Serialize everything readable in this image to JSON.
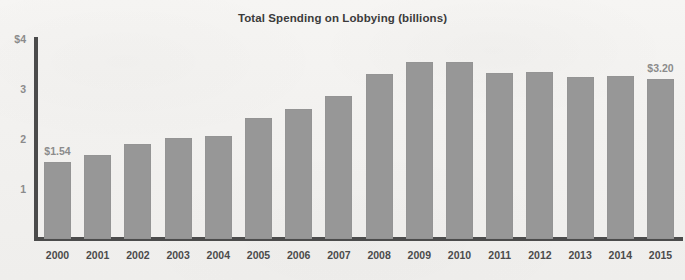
{
  "chart_data": {
    "type": "bar",
    "title": "Total Spending on Lobbying (billions)",
    "xlabel": "",
    "ylabel": "",
    "ylim": [
      0,
      4
    ],
    "grid": false,
    "legend": "none",
    "y_ticks": [
      "$4",
      "3",
      "2",
      "1"
    ],
    "y_tick_values": [
      4,
      3,
      2,
      1
    ],
    "categories": [
      "2000",
      "2001",
      "2002",
      "2003",
      "2004",
      "2005",
      "2006",
      "2007",
      "2008",
      "2009",
      "2010",
      "2011",
      "2012",
      "2013",
      "2014",
      "2015"
    ],
    "values": [
      1.54,
      1.68,
      1.9,
      2.03,
      2.07,
      2.42,
      2.6,
      2.86,
      3.3,
      3.55,
      3.55,
      3.32,
      3.34,
      3.24,
      3.26,
      3.2
    ],
    "annotations": [
      {
        "category": "2000",
        "text": "$1.54"
      },
      {
        "category": "2015",
        "text": "$3.20"
      }
    ],
    "colors": {
      "bar": "#979797",
      "axis": "#4b4b4b",
      "title_text": "#3b3b3b",
      "x_tick_text": "#4b4b4b",
      "y_tick_text": "#8b8b8b",
      "value_label_text": "#8b8b8b",
      "background": "#f4f3f1"
    }
  }
}
